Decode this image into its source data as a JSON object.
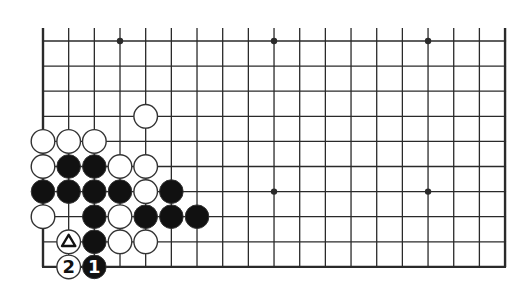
{
  "diagram": {
    "type": "go-board-partial",
    "columns": 19,
    "rows": 10,
    "origin": {
      "x": 43,
      "y": 41
    },
    "spacing": {
      "x": 25.67,
      "y": 25.1
    },
    "top_open_extension": 13,
    "edges": [
      "left",
      "right",
      "bottom"
    ],
    "star_points": [
      {
        "col": 3,
        "row": 0
      },
      {
        "col": 9,
        "row": 0
      },
      {
        "col": 15,
        "row": 0
      },
      {
        "col": 9,
        "row": 6
      },
      {
        "col": 15,
        "row": 6
      }
    ],
    "stones": [
      {
        "col": 4,
        "row": 3,
        "color": "white"
      },
      {
        "col": 0,
        "row": 4,
        "color": "white"
      },
      {
        "col": 1,
        "row": 4,
        "color": "white"
      },
      {
        "col": 2,
        "row": 4,
        "color": "white"
      },
      {
        "col": 0,
        "row": 5,
        "color": "white"
      },
      {
        "col": 1,
        "row": 5,
        "color": "black"
      },
      {
        "col": 2,
        "row": 5,
        "color": "black"
      },
      {
        "col": 3,
        "row": 5,
        "color": "white"
      },
      {
        "col": 4,
        "row": 5,
        "color": "white"
      },
      {
        "col": 0,
        "row": 6,
        "color": "black"
      },
      {
        "col": 1,
        "row": 6,
        "color": "black"
      },
      {
        "col": 2,
        "row": 6,
        "color": "black"
      },
      {
        "col": 3,
        "row": 6,
        "color": "black"
      },
      {
        "col": 4,
        "row": 6,
        "color": "white"
      },
      {
        "col": 5,
        "row": 6,
        "color": "black"
      },
      {
        "col": 0,
        "row": 7,
        "color": "white"
      },
      {
        "col": 2,
        "row": 7,
        "color": "black"
      },
      {
        "col": 3,
        "row": 7,
        "color": "white"
      },
      {
        "col": 4,
        "row": 7,
        "color": "black"
      },
      {
        "col": 5,
        "row": 7,
        "color": "black"
      },
      {
        "col": 6,
        "row": 7,
        "color": "black"
      },
      {
        "col": 1,
        "row": 8,
        "color": "white",
        "mark": "triangle"
      },
      {
        "col": 2,
        "row": 8,
        "color": "black"
      },
      {
        "col": 3,
        "row": 8,
        "color": "white"
      },
      {
        "col": 4,
        "row": 8,
        "color": "white"
      },
      {
        "col": 1,
        "row": 9,
        "color": "white",
        "label": "2"
      },
      {
        "col": 2,
        "row": 9,
        "color": "black",
        "label": "1"
      }
    ],
    "colors": {
      "background": "#ffffff",
      "line": "#2a2a2a",
      "black_stone": "#111111",
      "white_stone": "#ffffff",
      "stone_outline": "#333333"
    }
  }
}
